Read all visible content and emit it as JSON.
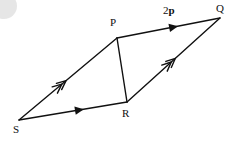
{
  "figure": {
    "type": "vector-parallelogram-diagram",
    "canvas": {
      "width": 232,
      "height": 147,
      "background": "#ffffff"
    },
    "stroke_color": "#111111",
    "vertices": [
      {
        "id": "S",
        "label": "S",
        "x": 19,
        "y": 120,
        "label_x": 13,
        "label_y": 124
      },
      {
        "id": "P",
        "label": "P",
        "x": 117,
        "y": 38,
        "label_x": 110,
        "label_y": 17
      },
      {
        "id": "R",
        "label": "R",
        "x": 127,
        "y": 102,
        "label_x": 122,
        "label_y": 108
      },
      {
        "id": "Q",
        "label": "Q",
        "x": 220,
        "y": 18,
        "label_x": 216,
        "label_y": 3
      }
    ],
    "edges": [
      {
        "id": "SP",
        "from": "S",
        "to": "P",
        "arrow": "double-chevron",
        "arrow_t": 0.48
      },
      {
        "id": "SR",
        "from": "S",
        "to": "R",
        "arrow": "single-solid",
        "arrow_t": 0.56
      },
      {
        "id": "PQ",
        "from": "P",
        "to": "Q",
        "arrow": "single-solid",
        "arrow_t": 0.55
      },
      {
        "id": "RQ",
        "from": "R",
        "to": "Q",
        "arrow": "double-chevron",
        "arrow_t": 0.52
      },
      {
        "id": "PR",
        "from": "P",
        "to": "R",
        "arrow": "none",
        "arrow_t": 0.5
      }
    ],
    "vector_labels": [
      {
        "id": "2p",
        "prefix": "2",
        "symbol": "p",
        "x": 163,
        "y": 5,
        "edge": "PQ"
      }
    ],
    "artifacts": [
      {
        "id": "corner-smudge",
        "shape": "circle",
        "color": "#e2e2e2"
      }
    ]
  }
}
